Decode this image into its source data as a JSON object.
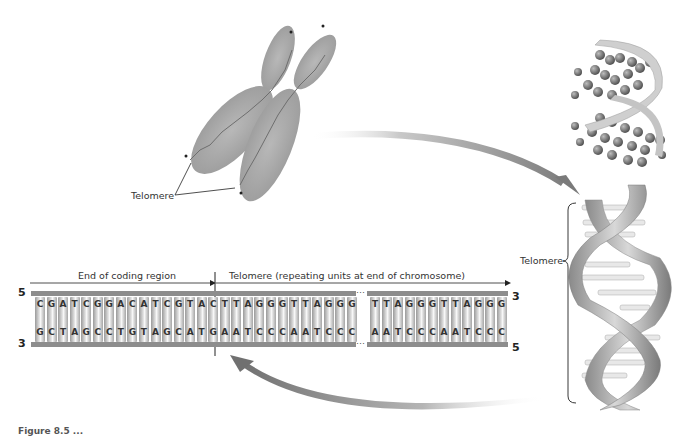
{
  "chromosome": {
    "label": "Telomere"
  },
  "helix": {
    "label": "Telomere"
  },
  "ladder": {
    "left_region_label": "End of coding region",
    "right_region_label": "Telomere (repeating units at end of chromosome)",
    "top_left_end": "5",
    "bottom_left_end": "3",
    "top_right_end": "3",
    "bottom_right_end": "5",
    "ellipsis": "…",
    "segment1_top": [
      "C",
      "G",
      "A",
      "T",
      "C",
      "G",
      "G",
      "A",
      "C",
      "A",
      "T",
      "C",
      "G",
      "T",
      "A",
      "C",
      "T",
      "T",
      "A",
      "G",
      "G",
      "G",
      "T",
      "T",
      "A",
      "G",
      "G",
      "G"
    ],
    "segment1_bottom": [
      "G",
      "C",
      "T",
      "A",
      "G",
      "C",
      "C",
      "T",
      "G",
      "T",
      "A",
      "G",
      "C",
      "A",
      "T",
      "G",
      "A",
      "A",
      "T",
      "C",
      "C",
      "C",
      "A",
      "A",
      "T",
      "C",
      "C",
      "C"
    ],
    "segment2_top": [
      "T",
      "T",
      "A",
      "G",
      "G",
      "G",
      "T",
      "T",
      "A",
      "G",
      "G",
      "G"
    ],
    "segment2_bottom": [
      "A",
      "A",
      "T",
      "C",
      "C",
      "C",
      "A",
      "A",
      "T",
      "C",
      "C",
      "C"
    ]
  },
  "caption": {
    "text": "Figure 8.5 ..."
  }
}
